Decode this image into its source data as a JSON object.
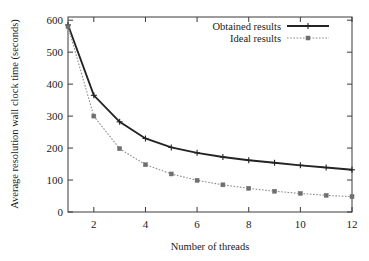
{
  "chart_data": {
    "type": "line",
    "title": "",
    "xlabel": "Number of threads",
    "ylabel": "Average resolution wall clock time (seconds)",
    "x": [
      1,
      2,
      3,
      4,
      5,
      6,
      7,
      8,
      9,
      10,
      11,
      12
    ],
    "series": [
      {
        "name": "Obtained results",
        "values": [
          585,
          365,
          282,
          230,
          202,
          185,
          172,
          162,
          154,
          146,
          139,
          132
        ],
        "style": "solid",
        "marker": "plus",
        "color": "#232323"
      },
      {
        "name": "Ideal results",
        "values": [
          580,
          300,
          198,
          148,
          119,
          99,
          85,
          74,
          65,
          58,
          52,
          48
        ],
        "style": "dotted",
        "marker": "square",
        "color": "#6f6f6f"
      }
    ],
    "xlim": [
      1,
      12
    ],
    "ylim": [
      0,
      610
    ],
    "xticks": [
      2,
      4,
      6,
      8,
      10,
      12
    ],
    "xtick_labels": [
      "2",
      "4",
      "6",
      "8",
      "10",
      "12"
    ],
    "yticks": [
      0,
      100,
      200,
      300,
      400,
      500,
      600
    ],
    "ytick_labels": [
      "0",
      "100",
      "200",
      "300",
      "400",
      "500",
      "600"
    ],
    "grid": false,
    "legend_position": "top-right-inside"
  },
  "legend": {
    "entries": [
      {
        "label": "Obtained results"
      },
      {
        "label": "Ideal results"
      }
    ]
  },
  "axes": {
    "x_title": "Number of threads",
    "y_title": "Average resolution wall clock time (seconds)",
    "y_labels": [
      "600",
      "500",
      "400",
      "300",
      "200",
      "100",
      "0"
    ],
    "x_labels": [
      "2",
      "4",
      "6",
      "8",
      "10",
      "12"
    ]
  }
}
